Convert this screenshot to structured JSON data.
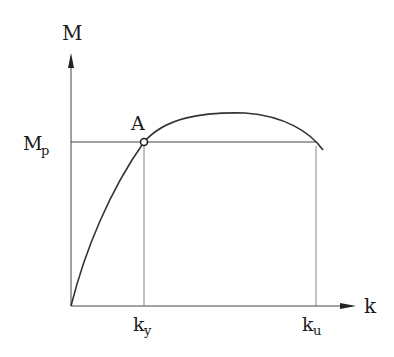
{
  "diagram": {
    "y_axis_label": "M",
    "x_axis_label": "k",
    "mp_label": "M",
    "mp_subscript": "p",
    "point_label": "A",
    "ky_label": "k",
    "ky_subscript": "y",
    "ku_label": "k",
    "ku_subscript": "u",
    "line_color": "#333333"
  }
}
